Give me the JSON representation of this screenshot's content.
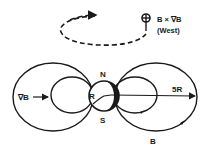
{
  "diagram": {
    "drift_direction": {
      "symbol": "⊕",
      "label_line1": "B × ∇B",
      "label_line2": "(West)"
    },
    "labels": {
      "grad_b": "∇B",
      "north": "N",
      "south": "S",
      "earth_radius": "R",
      "distance": "5R",
      "field": "B"
    },
    "colors": {
      "ink": "#1a1a1a",
      "background": "#ffffff"
    }
  }
}
